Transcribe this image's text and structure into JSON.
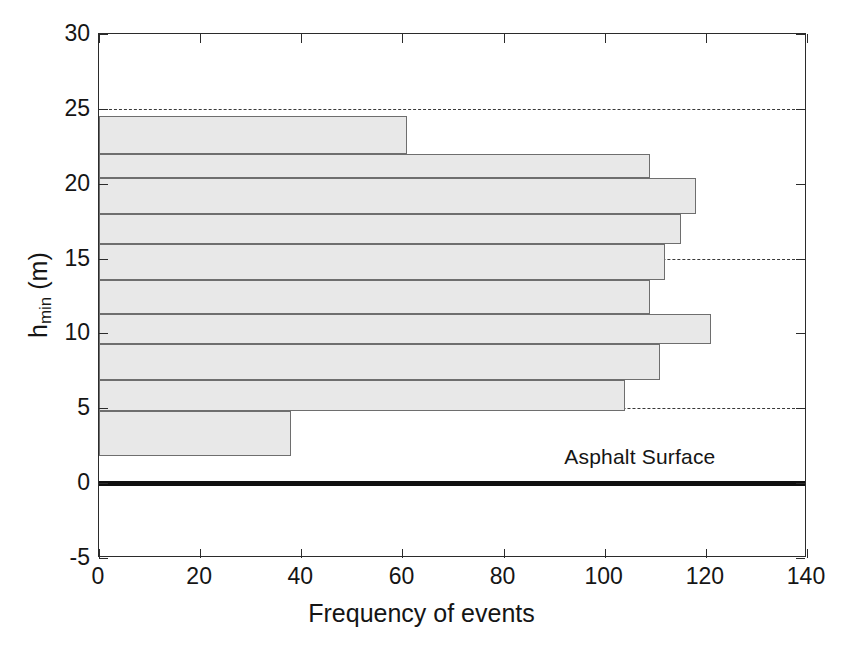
{
  "chart_data": {
    "type": "bar",
    "orientation": "horizontal",
    "title": "",
    "xlabel": "Frequency of events",
    "ylabel_main": "h",
    "ylabel_sub": "min",
    "ylabel_unit": " (m)",
    "ylabel_full": "h_min (m)",
    "xlim": [
      0,
      140
    ],
    "ylim": [
      -5,
      30
    ],
    "xticks": [
      0,
      20,
      40,
      60,
      80,
      100,
      120,
      140
    ],
    "xticklabels": [
      "0",
      "20",
      "40",
      "60",
      "80",
      "100",
      "120",
      "140"
    ],
    "yticks": [
      -5,
      0,
      5,
      10,
      15,
      20,
      25,
      30
    ],
    "yticklabels": [
      "-5",
      "0",
      "5",
      "10",
      "15",
      "20",
      "25",
      "30"
    ],
    "grid": "dashed-horizontal",
    "gridlines_y": [
      25,
      15,
      5
    ],
    "legend": "none",
    "bar_fill_color": "#e8e8e8",
    "bar_edge_color": "#6e6e6e",
    "surface_line_color": "#101010",
    "annotations": [
      {
        "text": "Asphalt Surface",
        "x": 92,
        "y": 1.6
      }
    ],
    "bin_edges": [
      1.8,
      4.8,
      6.9,
      9.3,
      11.3,
      13.6,
      16.0,
      18.0,
      20.4,
      22.0,
      24.5
    ],
    "categories": [
      "1.8-4.8",
      "4.8-6.9",
      "6.9-9.3",
      "9.3-11.3",
      "11.3-13.6",
      "13.6-16.0",
      "16.0-18.0",
      "18.0-20.4",
      "20.4-22.0",
      "22.0-24.5"
    ],
    "bars": [
      {
        "y_low": 22.0,
        "y_high": 24.5,
        "value": 61
      },
      {
        "y_low": 20.4,
        "y_high": 22.0,
        "value": 109
      },
      {
        "y_low": 18.0,
        "y_high": 20.4,
        "value": 118
      },
      {
        "y_low": 16.0,
        "y_high": 18.0,
        "value": 115
      },
      {
        "y_low": 13.6,
        "y_high": 16.0,
        "value": 112
      },
      {
        "y_low": 11.3,
        "y_high": 13.6,
        "value": 109
      },
      {
        "y_low": 9.3,
        "y_high": 11.3,
        "value": 121
      },
      {
        "y_low": 6.9,
        "y_high": 9.3,
        "value": 111
      },
      {
        "y_low": 4.8,
        "y_high": 6.9,
        "value": 104
      },
      {
        "y_low": 1.8,
        "y_high": 4.8,
        "value": 38
      }
    ],
    "values": [
      61,
      109,
      118,
      115,
      112,
      109,
      121,
      111,
      104,
      38
    ],
    "surface_line": {
      "y": 0,
      "label": "Asphalt Surface",
      "thickness_px": 5
    }
  }
}
